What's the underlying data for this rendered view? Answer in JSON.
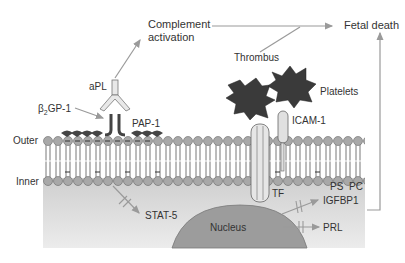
{
  "labels": {
    "complement_line1": "Complement",
    "complement_line2": "activation",
    "fetal_death": "Fetal death",
    "thrombus": "Thrombus",
    "platelets": "Platelets",
    "apl": "aPL",
    "b2gp1_beta": "β",
    "b2gp1_sub": "2",
    "b2gp1_rest": "GP-1",
    "pap1": "PAP-1",
    "icam1": "ICAM-1",
    "outer": "Outer",
    "inner": "Inner",
    "tf": "TF",
    "ps": "PS",
    "pc": "PC",
    "stat5": "STAT-5",
    "igfbp1": "IGFBP1",
    "prl": "PRL",
    "nucleus": "Nucleus"
  },
  "colors": {
    "arrow": "#9a9a9a",
    "lipid_head": "#a8a8a8",
    "cytoplasm": "#dedede",
    "nucleus": "#9c9c9c",
    "platelet": "#3a3a3a",
    "text": "#333333"
  }
}
